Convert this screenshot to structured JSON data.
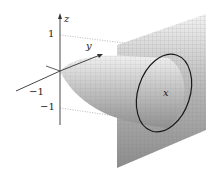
{
  "figure": {
    "type": "3d-surface-diagram",
    "axes": {
      "z_label": "z",
      "y_label": "y",
      "x_label": "x"
    },
    "ticks": {
      "z_pos": "1",
      "z_neg": "−1",
      "y_neg": "−1"
    },
    "colors": {
      "axis": "#333333",
      "surface_light": "#e6e6e6",
      "surface_dark": "#8a8a8a",
      "plane": "#a8a8a8",
      "ellipse": "#1a1a1a",
      "guide": "#9a9a9a"
    }
  }
}
